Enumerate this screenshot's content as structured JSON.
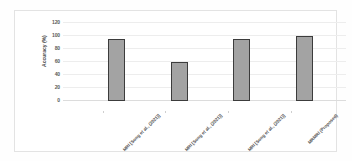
{
  "chart_data": {
    "type": "bar",
    "title": "",
    "xlabel": "",
    "ylabel": "Accuracy (%)",
    "ylim": [
      0,
      120
    ],
    "yticks": [
      0,
      20,
      40,
      60,
      80,
      100,
      120
    ],
    "grid": true,
    "legend": false,
    "categories": [
      "MRI [Song et al., (2021)]",
      "MRI [Song et al., (2021)]",
      "MRI [Song et al., (2021)]",
      "MRMRI (Proposed)"
    ],
    "values": [
      95,
      60,
      95,
      100
    ],
    "bar_color": "#a3a3a3",
    "bar_edge_color": "#3c3c3c"
  },
  "figure": {
    "background": "#ffffff",
    "frame_color": "#e3e3e3",
    "gridline_color": "#ededed",
    "axis_text_color": "#5a5a5a"
  }
}
